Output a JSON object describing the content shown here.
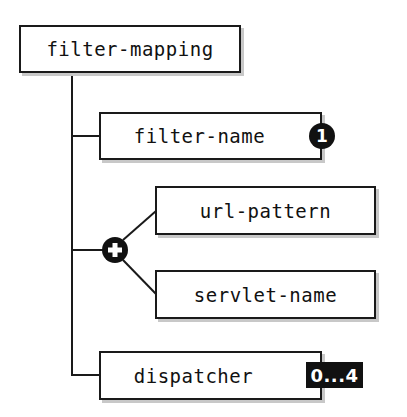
{
  "diagram": {
    "root": {
      "label": "filter-mapping"
    },
    "children": [
      {
        "label": "filter-name",
        "cardinality": "1"
      },
      {
        "type": "choice",
        "symbol": "+",
        "options": [
          {
            "label": "url-pattern"
          },
          {
            "label": "servlet-name"
          }
        ]
      },
      {
        "label": "dispatcher",
        "cardinality": "0...4"
      }
    ]
  },
  "colors": {
    "line": "#1a1a1a",
    "box_fill": "#ffffff",
    "badge": "#111111",
    "shadow": "#c8c8c8"
  }
}
